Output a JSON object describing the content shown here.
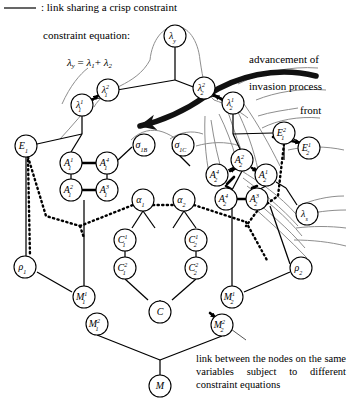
{
  "legend": {
    "crisp_link_text": ": link sharing a crisp constraint",
    "constraint_equation_title": "constraint equation:",
    "constraint_equation": "λy = λ1+ λ2",
    "advancement_line1": "advancement of",
    "advancement_line2": "invasion process",
    "front_label": "front",
    "bottom_note": "link between the nodes on the same variables subject to different constraint equations"
  },
  "colors": {
    "ink": "#000000",
    "background": "#ffffff",
    "soft_curve": "#8a8a8a",
    "thick_arrow": "#111111"
  },
  "nodes": [
    {
      "id": "lambda_y",
      "label": "λy",
      "base": "λ",
      "sub": "y",
      "sup": "",
      "x": 175,
      "y": 36,
      "r": 11
    },
    {
      "id": "lambda_2_1",
      "label": "λ²₁",
      "base": "λ",
      "sub": "1",
      "sup": "2",
      "x": 108,
      "y": 90,
      "r": 11
    },
    {
      "id": "lambda_1_1",
      "label": "λ¹₁",
      "base": "λ",
      "sub": "1",
      "sup": "1",
      "x": 82,
      "y": 105,
      "r": 11
    },
    {
      "id": "lambda_2_2",
      "label": "λ²₂",
      "base": "λ",
      "sub": "2",
      "sup": "2",
      "x": 204,
      "y": 88,
      "r": 11
    },
    {
      "id": "lambda_1_2",
      "label": "λ¹₂",
      "base": "λ",
      "sub": "2",
      "sup": "1",
      "x": 233,
      "y": 103,
      "r": 11
    },
    {
      "id": "E_1",
      "label": "E₁",
      "base": "E",
      "sub": "1",
      "sup": "",
      "x": 26,
      "y": 146,
      "r": 11
    },
    {
      "id": "E_2_1",
      "label": "E²₁",
      "base": "E",
      "sub": "1",
      "sup": "2",
      "x": 284,
      "y": 133,
      "r": 11
    },
    {
      "id": "E_1_2",
      "label": "E¹₂",
      "base": "E",
      "sub": "2",
      "sup": "1",
      "x": 309,
      "y": 148,
      "r": 11
    },
    {
      "id": "sigma_1b",
      "label": "σ1B",
      "base": "σ",
      "sub": "1B",
      "sup": "",
      "x": 144,
      "y": 145,
      "r": 11
    },
    {
      "id": "sigma_1c",
      "label": "σ1C",
      "base": "σ",
      "sub": "1C",
      "sup": "",
      "x": 183,
      "y": 145,
      "r": 11
    },
    {
      "id": "A_1_1",
      "label": "A¹₁",
      "base": "A",
      "sub": "1",
      "sup": "1",
      "x": 71,
      "y": 163,
      "r": 11
    },
    {
      "id": "A_4_1",
      "label": "A⁴₁",
      "base": "A",
      "sub": "1",
      "sup": "4",
      "x": 107,
      "y": 163,
      "r": 11
    },
    {
      "id": "A_2_1",
      "label": "A²₁",
      "base": "A",
      "sub": "1",
      "sup": "2",
      "x": 71,
      "y": 190,
      "r": 11
    },
    {
      "id": "A_3_1",
      "label": "A³₁",
      "base": "A",
      "sub": "1",
      "sup": "3",
      "x": 107,
      "y": 190,
      "r": 11
    },
    {
      "id": "A_2_2",
      "label": "A²₂",
      "base": "A",
      "sub": "2",
      "sup": "2",
      "x": 242,
      "y": 160,
      "r": 11
    },
    {
      "id": "A_4_2_left",
      "label": "A⁴₂",
      "base": "A",
      "sub": "2",
      "sup": "4",
      "x": 217,
      "y": 175,
      "r": 11
    },
    {
      "id": "A_1_2",
      "label": "A¹₂",
      "base": "A",
      "sub": "2",
      "sup": "1",
      "x": 266,
      "y": 175,
      "r": 11
    },
    {
      "id": "A_4_2",
      "label": "A⁴₂",
      "base": "A",
      "sub": "2",
      "sup": "4",
      "x": 226,
      "y": 199,
      "r": 11
    },
    {
      "id": "A_3_2",
      "label": "A³₂",
      "base": "A",
      "sub": "2",
      "sup": "3",
      "x": 257,
      "y": 199,
      "r": 11
    },
    {
      "id": "alpha_1",
      "label": "α₁",
      "base": "α",
      "sub": "1",
      "sup": "",
      "x": 143,
      "y": 200,
      "r": 11
    },
    {
      "id": "alpha_2",
      "label": "α₂",
      "base": "α",
      "sub": "2",
      "sup": "",
      "x": 184,
      "y": 200,
      "r": 11
    },
    {
      "id": "lambda_s",
      "label": "λs",
      "base": "λ",
      "sub": "s",
      "sup": "",
      "x": 307,
      "y": 214,
      "r": 11
    },
    {
      "id": "rho_1",
      "label": "ρ₁",
      "base": "ρ",
      "sub": "1",
      "sup": "",
      "x": 25,
      "y": 267,
      "r": 11
    },
    {
      "id": "rho_2",
      "label": "ρ₂",
      "base": "ρ",
      "sub": "2",
      "sup": "",
      "x": 301,
      "y": 268,
      "r": 11
    },
    {
      "id": "C_1_1",
      "label": "C¹₁",
      "base": "C",
      "sub": "1",
      "sup": "1",
      "x": 125,
      "y": 240,
      "r": 11
    },
    {
      "id": "C_2_1",
      "label": "C²₁",
      "base": "C",
      "sub": "1",
      "sup": "2",
      "x": 125,
      "y": 268,
      "r": 11
    },
    {
      "id": "C_1_2",
      "label": "C¹₂",
      "base": "C",
      "sub": "2",
      "sup": "1",
      "x": 196,
      "y": 240,
      "r": 11
    },
    {
      "id": "C_2_2",
      "label": "C²₂",
      "base": "C",
      "sub": "2",
      "sup": "2",
      "x": 196,
      "y": 268,
      "r": 11
    },
    {
      "id": "C",
      "label": "C",
      "base": "C",
      "sub": "",
      "sup": "",
      "x": 160,
      "y": 312,
      "r": 11
    },
    {
      "id": "M_1_1",
      "label": "M¹₁",
      "base": "M",
      "sub": "1",
      "sup": "1",
      "x": 84,
      "y": 297,
      "r": 11
    },
    {
      "id": "M_2_1",
      "label": "M²₁",
      "base": "M",
      "sub": "1",
      "sup": "2",
      "x": 97,
      "y": 324,
      "r": 11
    },
    {
      "id": "M_1_2",
      "label": "M¹₂",
      "base": "M",
      "sub": "2",
      "sup": "1",
      "x": 232,
      "y": 297,
      "r": 11
    },
    {
      "id": "M_2_2",
      "label": "M²₂",
      "base": "M",
      "sub": "2",
      "sup": "2",
      "x": 222,
      "y": 325,
      "r": 11
    },
    {
      "id": "M",
      "label": "M",
      "base": "M",
      "sub": "",
      "sup": "",
      "x": 160,
      "y": 386,
      "r": 11
    }
  ]
}
